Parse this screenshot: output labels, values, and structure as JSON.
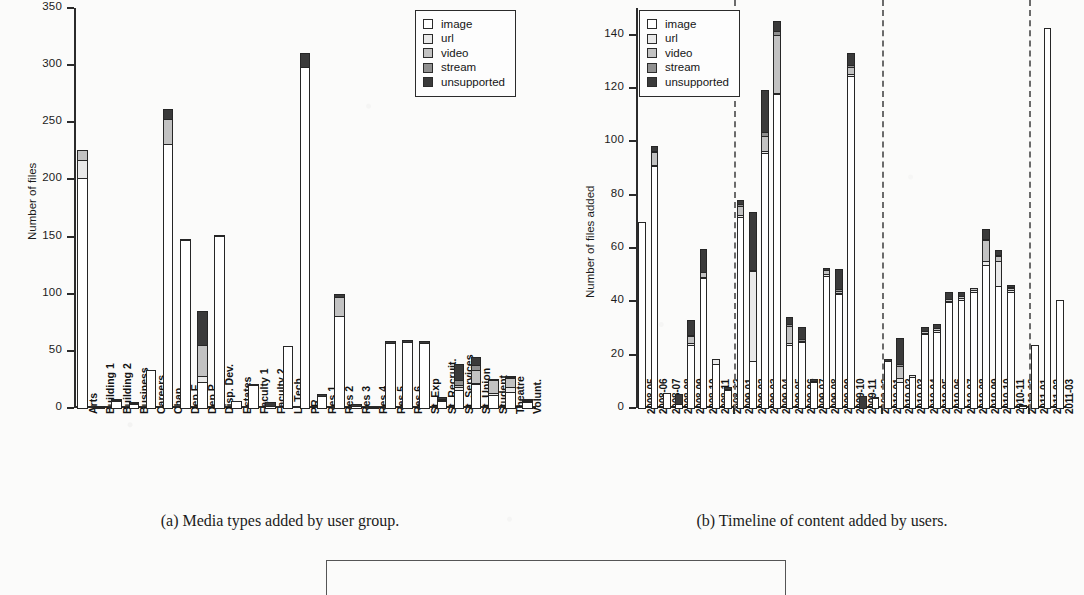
{
  "figure": {
    "caption_a": "(a) Media types added by user group.",
    "caption_b": "(b) Timeline of content added by users."
  },
  "legend": {
    "entries": [
      {
        "label": "image",
        "color": "#ffffff"
      },
      {
        "label": "url",
        "color": "#e9e9e9"
      },
      {
        "label": "video",
        "color": "#c2c2c2"
      },
      {
        "label": "stream",
        "color": "#8f8f8f"
      },
      {
        "label": "unsupported",
        "color": "#3a3a3a"
      }
    ]
  },
  "chart_data": [
    {
      "type": "bar",
      "id": "panel-a",
      "title": "(a) Media types added by user group.",
      "stacked": true,
      "xlabel": "",
      "ylabel": "Number of files",
      "ylim": [
        0,
        350
      ],
      "yticks": [
        0,
        50,
        100,
        150,
        200,
        250,
        300,
        350
      ],
      "grid": false,
      "legend_position": "top-right",
      "categories": [
        "Arts",
        "Building 1",
        "Building 2",
        "Business",
        "Careers",
        "Chap",
        "Dep E",
        "Dep P",
        "Disp. Dev.",
        "Estates",
        "Faculty 1",
        "Faculty 2",
        "L. Tech",
        "PR",
        "Res 1",
        "Res 2",
        "Res 3",
        "Res 4",
        "Res 5",
        "Res 6",
        "St. Exp",
        "St. Recruit.",
        "St. Services",
        "St. Union",
        "Student",
        "Theatre",
        "Volunt."
      ],
      "series": [
        {
          "name": "image",
          "values": [
            202,
            2,
            7,
            4,
            34,
            232,
            148,
            24,
            151,
            7,
            21,
            3,
            55,
            299,
            11,
            81,
            3,
            1,
            58,
            59,
            58,
            7,
            17,
            22,
            12,
            15,
            6
          ]
        },
        {
          "name": "url",
          "values": [
            17,
            0,
            0,
            0,
            0,
            0,
            0,
            6,
            0,
            0,
            0,
            0,
            0,
            0,
            0,
            0,
            0,
            0,
            0,
            0,
            0,
            0,
            3,
            2,
            3,
            5,
            0
          ]
        },
        {
          "name": "video",
          "values": [
            9,
            0,
            2,
            1,
            0,
            23,
            0,
            28,
            0,
            0,
            0,
            0,
            0,
            0,
            0,
            18,
            0,
            0,
            0,
            0,
            0,
            2,
            3,
            12,
            12,
            9,
            2
          ]
        },
        {
          "name": "stream",
          "values": [
            0,
            0,
            0,
            0,
            0,
            0,
            0,
            0,
            0,
            0,
            0,
            0,
            0,
            0,
            0,
            0,
            0,
            0,
            0,
            0,
            0,
            1,
            5,
            5,
            2,
            1,
            1
          ]
        },
        {
          "name": "unsupported",
          "values": [
            0,
            1,
            1,
            1,
            0,
            9,
            2,
            30,
            1,
            0,
            1,
            4,
            0,
            13,
            3,
            3,
            1,
            0,
            2,
            2,
            2,
            1,
            15,
            8,
            0,
            1,
            1
          ]
        }
      ]
    },
    {
      "type": "bar",
      "id": "panel-b",
      "title": "(b) Timeline of content added by users.",
      "stacked": true,
      "xlabel": "",
      "ylabel": "Number of files added",
      "ylim": [
        0,
        150
      ],
      "yticks": [
        0,
        20,
        40,
        60,
        80,
        100,
        120,
        140
      ],
      "grid": false,
      "legend_position": "top-left",
      "year_dividers_after": [
        "2008-12",
        "2009-12",
        "2010-12"
      ],
      "categories": [
        "2008-05",
        "2008-06",
        "2008-07",
        "2008-08",
        "2008-09",
        "2008-10",
        "2008-11",
        "2008-12",
        "2009-01",
        "2009-02",
        "2009-03",
        "2009-04",
        "2009-05",
        "2009-06",
        "2009-07",
        "2009-08",
        "2009-09",
        "2009-10",
        "2009-11",
        "2009-12",
        "2010-01",
        "2010-02",
        "2010-03",
        "2010-04",
        "2010-05",
        "2010-06",
        "2010-07",
        "2010-08",
        "2010-09",
        "2010-10",
        "2010-11",
        "2010-12",
        "2011-01",
        "2011-02",
        "2011-03"
      ],
      "series": [
        {
          "name": "image",
          "values": [
            70,
            91,
            6,
            2,
            24,
            49,
            17,
            7,
            72,
            18,
            96,
            118,
            24,
            25,
            10,
            50,
            43,
            125,
            0,
            4,
            18,
            10,
            12,
            28,
            29,
            40,
            41,
            44,
            54,
            46,
            44,
            1,
            24,
            143,
            41
          ]
        },
        {
          "name": "url",
          "values": [
            0,
            1,
            0,
            0,
            1,
            1,
            2,
            1,
            1,
            34,
            1,
            1,
            1,
            1,
            1,
            1,
            1,
            1,
            0,
            0,
            0,
            2,
            1,
            1,
            1,
            1,
            1,
            1,
            2,
            10,
            1,
            0,
            0,
            0,
            0
          ]
        },
        {
          "name": "video",
          "values": [
            0,
            5,
            0,
            0,
            3,
            2,
            0,
            0,
            4,
            1,
            6,
            22,
            7,
            0,
            0,
            2,
            1,
            3,
            0,
            0,
            0,
            5,
            0,
            1,
            1,
            1,
            1,
            1,
            8,
            2,
            1,
            0,
            0,
            0,
            0
          ]
        },
        {
          "name": "stream",
          "values": [
            0,
            1,
            0,
            0,
            1,
            0,
            0,
            0,
            1,
            0,
            2,
            2,
            1,
            1,
            0,
            0,
            1,
            1,
            0,
            0,
            0,
            1,
            0,
            0,
            0,
            0,
            0,
            0,
            1,
            1,
            1,
            0,
            0,
            0,
            0
          ]
        },
        {
          "name": "unsupported",
          "values": [
            0,
            2,
            0,
            4,
            6,
            9,
            0,
            1,
            2,
            22,
            16,
            4,
            3,
            5,
            1,
            1,
            8,
            5,
            5,
            1,
            1,
            10,
            0,
            2,
            2,
            3,
            2,
            0,
            4,
            2,
            1,
            1,
            0,
            0,
            0
          ]
        }
      ]
    }
  ]
}
